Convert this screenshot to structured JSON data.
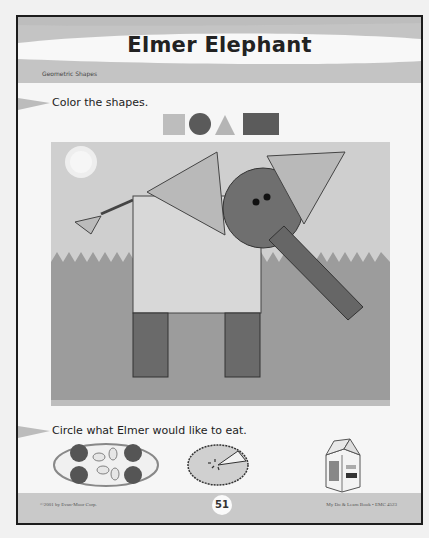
{
  "header": {
    "title": "Elmer Elephant",
    "subtitle": "Geometric Shapes"
  },
  "instructions": [
    {
      "label": "Color the shapes."
    },
    {
      "label": "Circle what Elmer would like to eat."
    }
  ],
  "shape_legend": [
    {
      "shape": "square",
      "color": "#bdbdbd"
    },
    {
      "shape": "circle",
      "color": "#5a5a5a"
    },
    {
      "shape": "triangle",
      "color": "#b5b5b5"
    },
    {
      "shape": "rectangle",
      "color": "#5b5b5b"
    }
  ],
  "scene": {
    "description": "Elephant built from geometric shapes",
    "colors": {
      "sky": "#cfcfcf",
      "grass": "#9c9c9c",
      "body": "#d8d8d8",
      "head": "#6f6f6f",
      "ears": "#b9b9b9",
      "trunk": "#666666",
      "legs": "#6a6a6a",
      "sun": "#f3f3f3"
    }
  },
  "food_choices": [
    {
      "name": "peanuts-and-nuts-plate"
    },
    {
      "name": "pie"
    },
    {
      "name": "milk-carton",
      "text": "Milk"
    }
  ],
  "footer": {
    "copyright": "©2001 by Evan-Moor Corp.",
    "page_number": "51",
    "book": "My Do & Learn Book • EMC 4523"
  }
}
